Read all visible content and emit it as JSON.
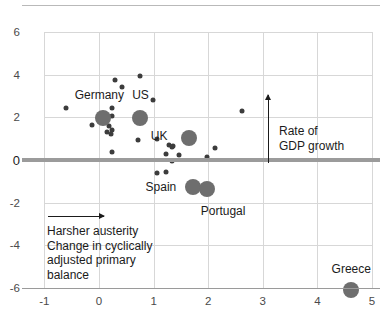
{
  "chart_data": {
    "type": "scatter",
    "title": "",
    "xlabel": "Change in cyclically adjusted primary balance",
    "ylabel": "Rate of GDP growth",
    "xlim": [
      -1.45,
      5.2
    ],
    "ylim": [
      -6.9,
      6.6
    ],
    "xticks": [
      "-1",
      "0",
      "1",
      "2",
      "3",
      "4",
      "5"
    ],
    "xtick_values": [
      -1,
      0,
      1,
      2,
      3,
      4,
      5
    ],
    "yticks": [
      "6",
      "4",
      "2",
      "0",
      "-2",
      "-4",
      "-6"
    ],
    "ytick_values": [
      6,
      4,
      2,
      0,
      -2,
      -4,
      -6
    ],
    "grid": true,
    "legend": "none",
    "zero_line_value": 0,
    "labeled_points": [
      {
        "name": "Germany",
        "x": 0.08,
        "y": 1.95,
        "size": "big",
        "label_dx": -4,
        "label_dy": -23
      },
      {
        "name": "US",
        "x": 0.76,
        "y": 1.95,
        "size": "big",
        "label_dx": 0,
        "label_dy": -23
      },
      {
        "name": "UK",
        "x": 1.65,
        "y": 1.05,
        "size": "big",
        "label_dx": -30,
        "label_dy": -2
      },
      {
        "name": "Spain",
        "x": 1.72,
        "y": -1.25,
        "size": "big",
        "label_dx": -32,
        "label_dy": 0
      },
      {
        "name": "Portugal",
        "x": 1.98,
        "y": -1.35,
        "size": "big",
        "label_dx": 16,
        "label_dy": 22
      },
      {
        "name": "Greece",
        "x": 4.62,
        "y": -6.1,
        "size": "big",
        "label_dx": 0,
        "label_dy": -21
      }
    ],
    "unlabeled_points": [
      {
        "x": 0.3,
        "y": 3.77
      },
      {
        "x": 0.76,
        "y": 3.95
      },
      {
        "x": 0.42,
        "y": 3.45
      },
      {
        "x": 0.98,
        "y": 2.82
      },
      {
        "x": -0.6,
        "y": 2.43
      },
      {
        "x": 2.62,
        "y": 2.3
      },
      {
        "x": 0.23,
        "y": 2.44
      },
      {
        "x": 0.23,
        "y": 2.05
      },
      {
        "x": -0.12,
        "y": 1.62
      },
      {
        "x": 0.18,
        "y": 1.58
      },
      {
        "x": 0.24,
        "y": 1.42
      },
      {
        "x": 0.14,
        "y": 1.3
      },
      {
        "x": 0.22,
        "y": 1.24
      },
      {
        "x": 0.72,
        "y": 0.95
      },
      {
        "x": 1.07,
        "y": 1.0
      },
      {
        "x": 1.28,
        "y": 0.72
      },
      {
        "x": 1.36,
        "y": 0.68
      },
      {
        "x": 1.33,
        "y": 0.62
      },
      {
        "x": 0.23,
        "y": 0.38
      },
      {
        "x": 1.22,
        "y": 0.3
      },
      {
        "x": 2.12,
        "y": 0.55
      },
      {
        "x": 1.46,
        "y": 0.22
      },
      {
        "x": 1.98,
        "y": 0.12
      },
      {
        "x": 1.34,
        "y": -0.05
      },
      {
        "x": 1.07,
        "y": -0.62
      },
      {
        "x": 1.22,
        "y": -0.58
      }
    ]
  },
  "annotations": {
    "growth": {
      "line1": "Rate of",
      "line2": "GDP growth"
    },
    "austerity": {
      "heading": "Harsher austerity",
      "line1": "Change in cyclically",
      "line2": "adjusted primary",
      "line3": "balance"
    }
  }
}
